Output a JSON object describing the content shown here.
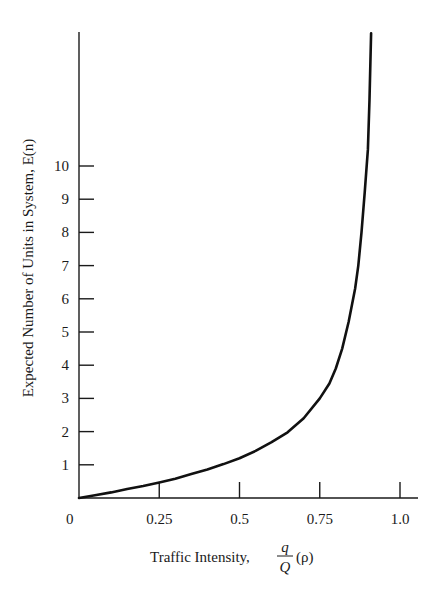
{
  "chart_data": {
    "type": "line",
    "title": "",
    "xlabel": "Traffic Intensity, q/Q (ρ)",
    "xlabel_parts": {
      "prefix": "Traffic Intensity,",
      "num": "q",
      "den": "Q",
      "suffix": "(ρ)"
    },
    "ylabel": "Expected Number of Units in System, E(n)",
    "xlim": [
      0,
      1.0
    ],
    "ylim": [
      0,
      14
    ],
    "x_ticks": [
      {
        "value": 0,
        "label": "0"
      },
      {
        "value": 0.25,
        "label": "0.25"
      },
      {
        "value": 0.5,
        "label": "0.5"
      },
      {
        "value": 0.75,
        "label": "0.75"
      },
      {
        "value": 1.0,
        "label": "1.0"
      }
    ],
    "y_ticks": [
      {
        "value": 1,
        "label": "1"
      },
      {
        "value": 2,
        "label": "2"
      },
      {
        "value": 3,
        "label": "3"
      },
      {
        "value": 4,
        "label": "4"
      },
      {
        "value": 5,
        "label": "5"
      },
      {
        "value": 6,
        "label": "6"
      },
      {
        "value": 7,
        "label": "7"
      },
      {
        "value": 8,
        "label": "8"
      },
      {
        "value": 9,
        "label": "9"
      },
      {
        "value": 10,
        "label": "10"
      }
    ],
    "grid": false,
    "legend": null,
    "series": [
      {
        "name": "E(n)",
        "x": [
          0,
          0.05,
          0.1,
          0.15,
          0.2,
          0.25,
          0.3,
          0.35,
          0.4,
          0.45,
          0.5,
          0.55,
          0.6,
          0.65,
          0.7,
          0.75,
          0.78,
          0.8,
          0.82,
          0.84,
          0.86,
          0.87,
          0.88,
          0.89,
          0.9,
          0.905,
          0.91
        ],
        "values": [
          0,
          0.08,
          0.17,
          0.27,
          0.36,
          0.47,
          0.58,
          0.72,
          0.86,
          1.02,
          1.2,
          1.42,
          1.68,
          1.98,
          2.4,
          3.0,
          3.45,
          3.9,
          4.5,
          5.3,
          6.3,
          7.0,
          8.0,
          9.2,
          10.5,
          12.0,
          14.0
        ]
      }
    ]
  }
}
